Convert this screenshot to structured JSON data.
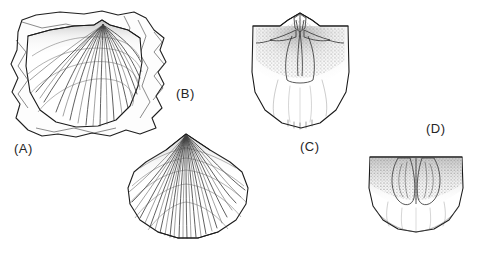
{
  "plate": {
    "background_color": "#ffffff",
    "ink_color": "#1a1a1a",
    "label_color": "#262626",
    "width": 494,
    "height": 253,
    "style": "stippled pen-and-ink scientific illustration",
    "subject": "fossil brachiopod shells"
  },
  "figures": [
    {
      "id": "a",
      "label": "(A)",
      "label_x": 14,
      "label_y": 141,
      "caption_text": "(A)",
      "description": "ribbed brachiopod shell exterior embedded in an irregular rock matrix fragment",
      "view": "exterior",
      "has_matrix": true,
      "box": {
        "x": 8,
        "y": 8,
        "w": 160,
        "h": 128
      }
    },
    {
      "id": "b",
      "label": "(B)",
      "label_x": 176,
      "label_y": 86,
      "caption_text": "(B)",
      "description": "costate brachiopod valve exterior with radiating ribs from the beak",
      "view": "exterior",
      "has_matrix": false,
      "box": {
        "x": 120,
        "y": 130,
        "w": 134,
        "h": 112
      }
    },
    {
      "id": "c",
      "label": "(C)",
      "label_x": 300,
      "label_y": 139,
      "caption_text": "(C)",
      "description": "brachiopod valve interior showing cardinal process, dental plates and muscle field",
      "view": "interior",
      "has_matrix": false,
      "box": {
        "x": 246,
        "y": 12,
        "w": 108,
        "h": 122
      }
    },
    {
      "id": "d",
      "label": "(D)",
      "label_x": 426,
      "label_y": 121,
      "caption_text": "(D)",
      "description": "brachiopod valve interior showing two large lobate muscle scars below the hinge",
      "view": "interior",
      "has_matrix": false,
      "box": {
        "x": 366,
        "y": 152,
        "w": 100,
        "h": 84
      }
    }
  ]
}
